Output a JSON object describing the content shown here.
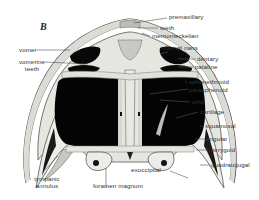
{
  "figure": {
    "panel_letter": "B",
    "colors": {
      "bone": "#e8e8e4",
      "bone_shade": "#bdbdb8",
      "cavity": "#050505",
      "outline": "#444444",
      "leader": "#555555",
      "text": "#333333"
    }
  },
  "labels": {
    "right": [
      {
        "id": "premaxillary",
        "text": "premaxillary"
      },
      {
        "id": "teeth",
        "text": "teeth"
      },
      {
        "id": "mentomeckelian",
        "text": "mentomeckelian"
      },
      {
        "id": "internal_naris",
        "text": "internal naris"
      },
      {
        "id": "dentary",
        "text": "dentary"
      },
      {
        "id": "palatine",
        "text": "palatine"
      },
      {
        "id": "sphenethmoid",
        "text": "sphenethmoid"
      },
      {
        "id": "parasphenoid",
        "text": "parasphenoid"
      },
      {
        "id": "orbit",
        "text": "orbit"
      },
      {
        "id": "cartilage",
        "text": "cartilage"
      },
      {
        "id": "squamosal",
        "text": "squamosal"
      },
      {
        "id": "angular",
        "text": "angular"
      },
      {
        "id": "pterygoid",
        "text": "pterygoid"
      },
      {
        "id": "quadratojugal",
        "text": "quadratojugal"
      }
    ],
    "left": [
      {
        "id": "vomer",
        "text": "vomer"
      },
      {
        "id": "vomerine_teeth_1",
        "text": "vomerine"
      },
      {
        "id": "vomerine_teeth_2",
        "text": "teeth"
      },
      {
        "id": "tympanic_annulus_1",
        "text": "tympanic"
      },
      {
        "id": "tympanic_annulus_2",
        "text": "annulus"
      }
    ],
    "bottom": [
      {
        "id": "exoccipital",
        "text": "exoccipital"
      },
      {
        "id": "foramen_magnum",
        "text": "foramen magnum"
      }
    ]
  }
}
